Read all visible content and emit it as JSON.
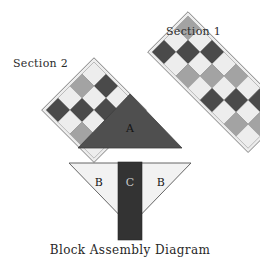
{
  "diagram": {
    "title": "Block Assembly Diagram",
    "background": "#ffffff",
    "ink": "#2b2b2b"
  },
  "palette": {
    "dark": "#4a4a4a",
    "medium": "#a3a3a3",
    "light": "#ededed",
    "outline": "#6e6e6e",
    "triangle_a_fill": "#4f4f4f",
    "triangle_b_fill": "#f2f2f2",
    "bar_c_fill": "#333333",
    "shadow": "#c9c9c9"
  },
  "labels": {
    "section1": "Section 1",
    "section2": "Section 2",
    "caption": "Block Assembly Diagram"
  },
  "pieces": {
    "a": "A",
    "b_left": "B",
    "b_right": "B",
    "c": "C"
  },
  "chart_data": {
    "type": "table",
    "title": "Block Assembly Diagram",
    "xlabel": "",
    "ylabel": "",
    "units": "checkerboard patches",
    "sections": [
      {
        "name": "Section 1",
        "shape": "rotated checkerboard strip",
        "rotation_deg": -45,
        "rows": 3,
        "cols": 8,
        "cell_px": 17,
        "grid": [
          [
            "medium",
            "light",
            "dark",
            "light",
            "medium",
            "light",
            "dark",
            "light"
          ],
          [
            "light",
            "dark",
            "light",
            "medium",
            "light",
            "dark",
            "light",
            "medium"
          ],
          [
            "dark",
            "light",
            "medium",
            "light",
            "dark",
            "light",
            "medium",
            "light"
          ]
        ]
      },
      {
        "name": "Section 2",
        "shape": "rotated checkerboard square",
        "rotation_deg": -45,
        "rows": 4,
        "cols": 4,
        "cell_px": 17,
        "grid": [
          [
            "light",
            "dark",
            "light",
            "medium"
          ],
          [
            "medium",
            "light",
            "dark",
            "light"
          ],
          [
            "light",
            "dark",
            "light",
            "medium"
          ],
          [
            "dark",
            "light",
            "medium",
            "light"
          ]
        ]
      }
    ],
    "units_list": [
      {
        "id": "A",
        "shape": "triangle",
        "orientation": "point-up",
        "fill": "dark"
      },
      {
        "id": "B",
        "shape": "triangle",
        "orientation": "point-down",
        "fill": "light",
        "count": 2
      },
      {
        "id": "C",
        "shape": "rectangle",
        "orientation": "vertical sash",
        "fill": "dark"
      }
    ],
    "categories": [
      "Section 1",
      "Section 2",
      "A",
      "B",
      "C"
    ],
    "values": [
      24,
      16,
      1,
      2,
      1
    ],
    "legend": [
      "dark",
      "medium",
      "light"
    ]
  }
}
